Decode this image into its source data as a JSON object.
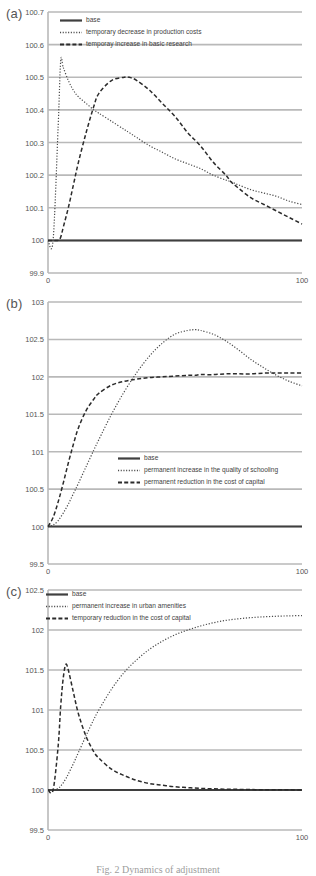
{
  "figure": {
    "caption": "Fig. 2 Dynamics of adjustment",
    "xaxis": {
      "min": 0,
      "max": 100,
      "ticks": [
        "0",
        "100"
      ]
    }
  },
  "panels": [
    {
      "id": "a",
      "label": "(a)",
      "yticks": [
        "100.7",
        "100.6",
        "100.5",
        "100.4",
        "100.3",
        "100.2",
        "100.1",
        "100",
        "99.9"
      ],
      "legend": [
        {
          "style": "solid",
          "label": "base"
        },
        {
          "style": "dotted",
          "label": "temporary decrease in production costs"
        },
        {
          "style": "dashed",
          "label": "temporay increase in basic research"
        }
      ]
    },
    {
      "id": "b",
      "label": "(b)",
      "yticks": [
        "103",
        "102.5",
        "102",
        "101.5",
        "101",
        "100.5",
        "100",
        "99.5"
      ],
      "legend": [
        {
          "style": "solid",
          "label": "base"
        },
        {
          "style": "dotted",
          "label": "permanent increase in the quality of schooling"
        },
        {
          "style": "dashed",
          "label": "permanent reduction in the cost of capital"
        }
      ]
    },
    {
      "id": "c",
      "label": "(c)",
      "yticks": [
        "102.5",
        "102",
        "101.5",
        "101",
        "100.5",
        "100",
        "99.5"
      ],
      "legend": [
        {
          "style": "solid",
          "label": "base"
        },
        {
          "style": "dotted",
          "label": "permanent increase in urban amenities"
        },
        {
          "style": "dashed",
          "label": "temporary reduction in the cost of capital"
        }
      ]
    }
  ],
  "colors": {
    "base_line": "#3f3f3f",
    "dotted_line": "#4a4a4a",
    "dashed_line": "#2b2b2b",
    "grid": "#b9b9b9",
    "text": "#555555"
  },
  "chart_data": [
    {
      "type": "line",
      "panel": "(a)",
      "title": "",
      "xlabel": "",
      "ylabel": "",
      "xlim": [
        0,
        100
      ],
      "ylim": [
        99.9,
        100.7
      ],
      "grid": true,
      "legend_position": "top-left",
      "x": [
        0,
        2,
        4,
        5,
        6,
        8,
        10,
        12,
        15,
        18,
        20,
        25,
        30,
        32,
        35,
        40,
        45,
        50,
        55,
        60,
        65,
        70,
        72,
        75,
        80,
        85,
        90,
        95,
        100
      ],
      "series": [
        {
          "name": "base",
          "style": "solid",
          "values": [
            100,
            100,
            100,
            100,
            100,
            100,
            100,
            100,
            100,
            100,
            100,
            100,
            100,
            100,
            100,
            100,
            100,
            100,
            100,
            100,
            100,
            100,
            100,
            100,
            100,
            100,
            100,
            100,
            100
          ]
        },
        {
          "name": "temporary decrease in production costs",
          "style": "dotted",
          "values": [
            100,
            100,
            100.35,
            100.55,
            100.53,
            100.49,
            100.46,
            100.44,
            100.42,
            100.4,
            100.39,
            100.365,
            100.34,
            100.33,
            100.315,
            100.29,
            100.27,
            100.25,
            100.235,
            100.22,
            100.2,
            100.185,
            100.18,
            100.17,
            100.155,
            100.145,
            100.135,
            100.12,
            100.11
          ]
        },
        {
          "name": "temporay increase in basic research",
          "style": "dashed",
          "values": [
            100,
            100,
            100,
            100.01,
            100.04,
            100.1,
            100.17,
            100.24,
            100.33,
            100.41,
            100.45,
            100.49,
            100.5,
            100.5,
            100.49,
            100.46,
            100.42,
            100.38,
            100.33,
            100.29,
            100.24,
            100.2,
            100.18,
            100.16,
            100.13,
            100.11,
            100.09,
            100.07,
            100.05
          ]
        }
      ]
    },
    {
      "type": "line",
      "panel": "(b)",
      "title": "",
      "xlabel": "",
      "ylabel": "",
      "xlim": [
        0,
        100
      ],
      "ylim": [
        99.5,
        103
      ],
      "grid": true,
      "legend_position": "center",
      "x": [
        0,
        2,
        4,
        6,
        8,
        10,
        12,
        15,
        18,
        20,
        25,
        30,
        35,
        40,
        45,
        50,
        55,
        58,
        60,
        65,
        70,
        75,
        80,
        85,
        90,
        95,
        100
      ],
      "series": [
        {
          "name": "base",
          "style": "solid",
          "values": [
            100,
            100,
            100,
            100,
            100,
            100,
            100,
            100,
            100,
            100,
            100,
            100,
            100,
            100,
            100,
            100,
            100,
            100,
            100,
            100,
            100,
            100,
            100,
            100,
            100,
            100,
            100
          ]
        },
        {
          "name": "permanent increase in the quality of schooling",
          "style": "dotted",
          "values": [
            100,
            100.02,
            100.08,
            100.18,
            100.3,
            100.44,
            100.58,
            100.8,
            101.02,
            101.16,
            101.5,
            101.8,
            102.06,
            102.28,
            102.45,
            102.57,
            102.62,
            102.63,
            102.62,
            102.57,
            102.48,
            102.36,
            102.23,
            102.12,
            102.02,
            101.94,
            101.88
          ]
        },
        {
          "name": "permanent reduction in the cost of capital",
          "style": "dashed",
          "values": [
            100,
            100.12,
            100.33,
            100.58,
            100.85,
            101.1,
            101.32,
            101.55,
            101.7,
            101.78,
            101.89,
            101.94,
            101.97,
            101.99,
            102.0,
            102.01,
            102.02,
            102.02,
            102.03,
            102.03,
            102.04,
            102.04,
            102.04,
            102.05,
            102.05,
            102.05,
            102.05
          ]
        }
      ]
    },
    {
      "type": "line",
      "panel": "(c)",
      "title": "",
      "xlabel": "",
      "ylabel": "",
      "xlim": [
        0,
        100
      ],
      "ylim": [
        99.5,
        102.5
      ],
      "grid": true,
      "legend_position": "top-left",
      "x": [
        0,
        2,
        4,
        5,
        6,
        7,
        8,
        10,
        12,
        15,
        18,
        20,
        25,
        30,
        35,
        40,
        45,
        50,
        55,
        60,
        65,
        70,
        75,
        80,
        85,
        90,
        95,
        100
      ],
      "series": [
        {
          "name": "base",
          "style": "solid",
          "values": [
            100,
            100,
            100,
            100,
            100,
            100,
            100,
            100,
            100,
            100,
            100,
            100,
            100,
            100,
            100,
            100,
            100,
            100,
            100,
            100,
            100,
            100,
            100,
            100,
            100,
            100,
            100,
            100
          ]
        },
        {
          "name": "permanent increase in urban amenities",
          "style": "dotted",
          "values": [
            100,
            100,
            100.02,
            100.05,
            100.09,
            100.14,
            100.2,
            100.33,
            100.47,
            100.68,
            100.88,
            101.0,
            101.26,
            101.47,
            101.63,
            101.76,
            101.86,
            101.94,
            102.0,
            102.05,
            102.09,
            102.12,
            102.14,
            102.155,
            102.165,
            102.172,
            102.177,
            102.18
          ]
        },
        {
          "name": "temporary reduction in the cost of capital",
          "style": "dashed",
          "values": [
            100,
            100,
            100.55,
            101.05,
            101.4,
            101.57,
            101.5,
            101.22,
            100.95,
            100.67,
            100.48,
            100.4,
            100.26,
            100.18,
            100.12,
            100.08,
            100.06,
            100.04,
            100.03,
            100.02,
            100.015,
            100.01,
            100.008,
            100.005,
            100.004,
            100.003,
            100.002,
            100
          ]
        }
      ]
    }
  ]
}
